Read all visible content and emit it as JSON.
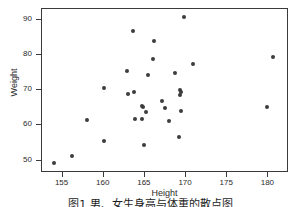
{
  "figure": {
    "caption": "图1 男、女生身高与体重的散点图"
  },
  "chart_data": {
    "type": "scatter",
    "title": "",
    "xlabel": "Height",
    "ylabel": "Weight",
    "xlim": [
      152.5,
      182.5
    ],
    "ylim": [
      46.5,
      93.0
    ],
    "grid": false,
    "legend": null,
    "marker_color": "#3c3c3c",
    "frame_color": "#3a3a3a",
    "xticks": [
      155,
      160,
      165,
      170,
      175,
      180
    ],
    "yticks": [
      50,
      60,
      70,
      80,
      90
    ],
    "series": [
      {
        "name": "observations",
        "points": [
          [
            153.9,
            49.2
          ],
          [
            156.2,
            51.4
          ],
          [
            158.0,
            61.6
          ],
          [
            160.0,
            55.5
          ],
          [
            160.0,
            70.7
          ],
          [
            162.8,
            75.4
          ],
          [
            163.0,
            68.8
          ],
          [
            163.6,
            86.8
          ],
          [
            163.7,
            69.4
          ],
          [
            163.8,
            61.9
          ],
          [
            164.6,
            61.8
          ],
          [
            164.7,
            65.4
          ],
          [
            164.8,
            65.2
          ],
          [
            164.9,
            54.3
          ],
          [
            165.1,
            63.8
          ],
          [
            165.4,
            74.3
          ],
          [
            166.1,
            83.9
          ],
          [
            166.0,
            78.9
          ],
          [
            167.1,
            66.8
          ],
          [
            167.4,
            65.0
          ],
          [
            167.9,
            61.3
          ],
          [
            168.6,
            74.8
          ],
          [
            169.1,
            56.6
          ],
          [
            169.3,
            70.1
          ],
          [
            169.4,
            69.5
          ],
          [
            169.3,
            68.5
          ],
          [
            169.4,
            64.2
          ],
          [
            169.8,
            90.8
          ],
          [
            170.9,
            77.5
          ],
          [
            179.8,
            65.3
          ],
          [
            180.6,
            79.3
          ]
        ]
      }
    ]
  }
}
